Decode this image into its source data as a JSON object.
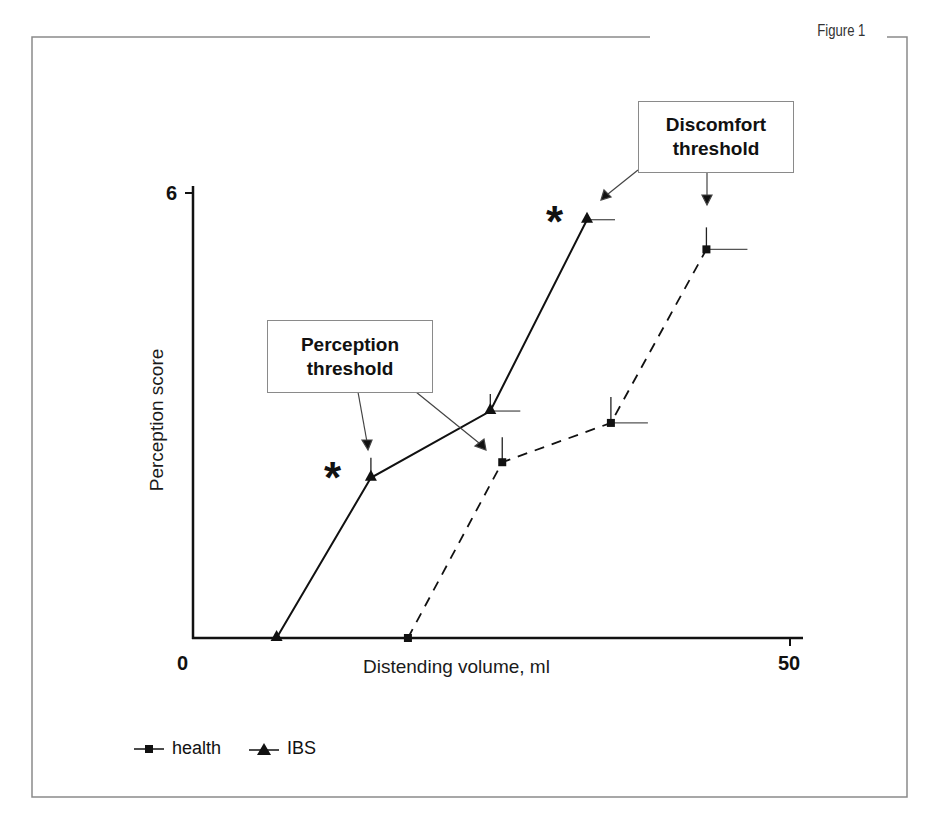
{
  "figure": {
    "label": "Figure 1"
  },
  "chart_data": {
    "type": "line",
    "title": "",
    "xlabel": "Distending volume, ml",
    "ylabel": "Perception score",
    "xlim": [
      0,
      50
    ],
    "ylim": [
      0,
      6
    ],
    "x_ticks": [
      "0",
      "50"
    ],
    "y_ticks": [
      "0",
      "6"
    ],
    "grid": false,
    "legend_position": "bottom-left",
    "series": [
      {
        "name": "health",
        "marker": "square",
        "line_style": "dashed",
        "x": [
          18.0,
          25.9,
          35.0,
          43.0
        ],
        "y": [
          0.0,
          2.37,
          2.9,
          5.24
        ],
        "error_bars": "one-sided (up and right), shown for points 2-4"
      },
      {
        "name": "IBS",
        "marker": "triangle",
        "line_style": "solid",
        "x": [
          7.0,
          14.9,
          24.9,
          33.0
        ],
        "y": [
          0.0,
          2.16,
          3.06,
          5.64
        ],
        "error_bars": "one-sided (up and right), shown for points 2-4"
      }
    ],
    "annotations": [
      {
        "text": "Perception threshold",
        "type": "callout-box",
        "points_to": [
          "IBS point at ~14.9 ml",
          "health point at ~25.9 ml"
        ]
      },
      {
        "text": "Discomfort threshold",
        "type": "callout-box",
        "points_to": [
          "IBS point at ~33.0 ml",
          "health point at ~43.0 ml"
        ]
      },
      {
        "text": "*",
        "type": "significance",
        "near": "IBS point at ~14.9 ml"
      },
      {
        "text": "*",
        "type": "significance",
        "near": "IBS point at ~33.0 ml"
      }
    ]
  },
  "labels": {
    "x_zero": "0",
    "x_max": "50",
    "y_max": "6",
    "x_title": "Distending volume, ml",
    "y_title": "Perception score",
    "callout_perception_line1": "Perception",
    "callout_perception_line2": "threshold",
    "callout_discomfort_line1": "Discomfort",
    "callout_discomfort_line2": "threshold",
    "star": "*"
  },
  "legend": {
    "items": [
      {
        "label": "health",
        "marker": "square"
      },
      {
        "label": "IBS",
        "marker": "triangle"
      }
    ]
  }
}
